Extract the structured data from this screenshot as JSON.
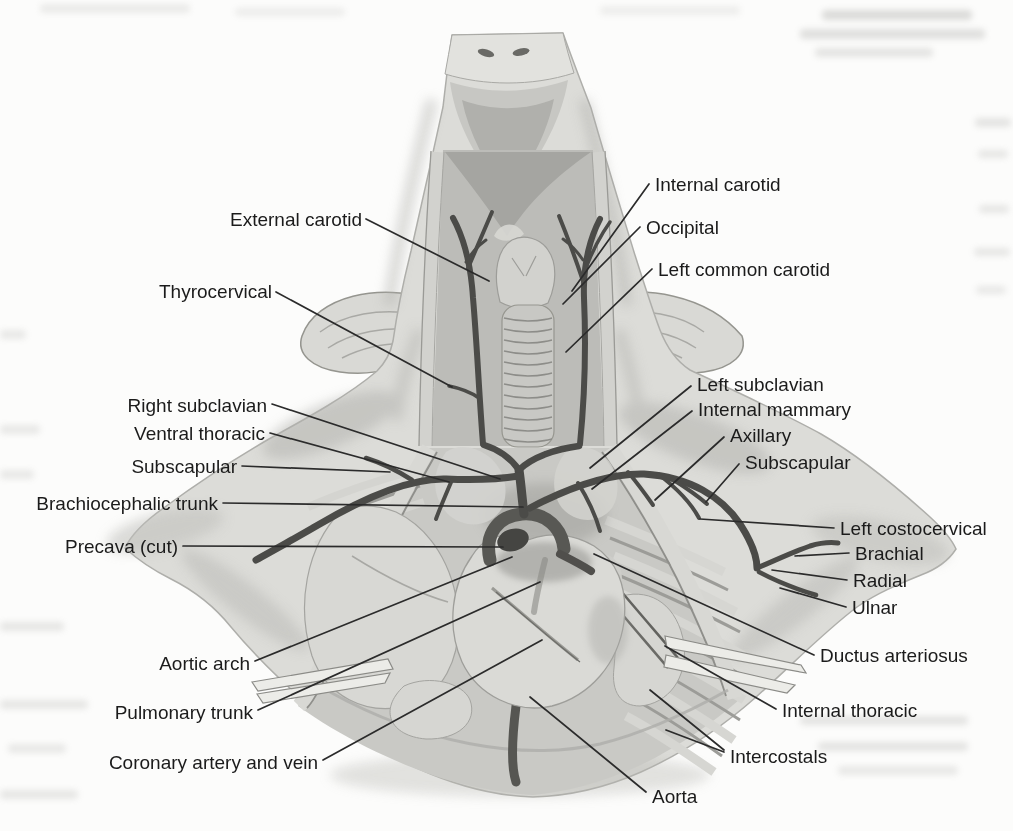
{
  "figure": {
    "type": "labeled-anatomical-illustration",
    "subject_note": "",
    "palette": {
      "paper": "#fcfcfb",
      "body_gray": "#dcdcd8",
      "shade_gray": "#b4b4b0",
      "vessel_dark": "#4b4b48",
      "bone_white": "#ecece8",
      "label_text": "#1b1b1b",
      "leader_line": "#2b2b2b"
    }
  },
  "style": {
    "label_color": "#1b1b1b",
    "leader_color": "#2b2b2b",
    "leader_width": 1.7,
    "label_font_size": 19
  },
  "labels": [
    {
      "id": "external-carotid",
      "text": "External carotid",
      "x": 362,
      "y": 219,
      "anchor": "end",
      "leaders": [
        [
          366,
          219,
          489,
          281
        ]
      ]
    },
    {
      "id": "thyrocervical",
      "text": "Thyrocervical",
      "x": 272,
      "y": 291,
      "anchor": "end",
      "leaders": [
        [
          276,
          292,
          452,
          387
        ]
      ]
    },
    {
      "id": "right-subclavian",
      "text": "Right subclavian",
      "x": 267,
      "y": 405,
      "anchor": "end",
      "leaders": [
        [
          272,
          404,
          500,
          479
        ]
      ]
    },
    {
      "id": "ventral-thoracic",
      "text": "Ventral thoracic",
      "x": 265,
      "y": 433,
      "anchor": "end",
      "leaders": [
        [
          270,
          433,
          449,
          482
        ]
      ]
    },
    {
      "id": "subscapular-left",
      "text": "Subscapular",
      "x": 237,
      "y": 466,
      "anchor": "end",
      "leaders": [
        [
          242,
          466,
          390,
          472
        ]
      ]
    },
    {
      "id": "brachiocephalic-trunk",
      "text": "Brachiocephalic trunk",
      "x": 218,
      "y": 503,
      "anchor": "end",
      "leaders": [
        [
          223,
          503,
          523,
          507
        ]
      ]
    },
    {
      "id": "precava-cut",
      "text": "Precava (cut)",
      "x": 178,
      "y": 546,
      "anchor": "end",
      "leaders": [
        [
          183,
          546,
          503,
          547
        ]
      ]
    },
    {
      "id": "aortic-arch",
      "text": "Aortic arch",
      "x": 250,
      "y": 663,
      "anchor": "end",
      "leaders": [
        [
          255,
          661,
          512,
          557
        ]
      ]
    },
    {
      "id": "pulmonary-trunk",
      "text": "Pulmonary trunk",
      "x": 253,
      "y": 712,
      "anchor": "end",
      "leaders": [
        [
          258,
          710,
          540,
          582
        ]
      ]
    },
    {
      "id": "coronary-artery-vein",
      "text": "Coronary artery and vein",
      "x": 318,
      "y": 762,
      "anchor": "end",
      "leaders": [
        [
          323,
          760,
          542,
          640
        ]
      ]
    },
    {
      "id": "internal-carotid",
      "text": "Internal carotid",
      "x": 655,
      "y": 184,
      "anchor": "start",
      "leaders": [
        [
          649,
          184,
          572,
          291
        ]
      ]
    },
    {
      "id": "occipital",
      "text": "Occipital",
      "x": 646,
      "y": 227,
      "anchor": "start",
      "leaders": [
        [
          640,
          227,
          563,
          304
        ]
      ]
    },
    {
      "id": "left-common-carotid",
      "text": "Left common carotid",
      "x": 658,
      "y": 269,
      "anchor": "start",
      "leaders": [
        [
          652,
          269,
          566,
          352
        ]
      ]
    },
    {
      "id": "left-subclavian",
      "text": "Left subclavian",
      "x": 697,
      "y": 384,
      "anchor": "start",
      "leaders": [
        [
          691,
          386,
          590,
          468
        ]
      ]
    },
    {
      "id": "internal-mammary",
      "text": "Internal mammary",
      "x": 698,
      "y": 409,
      "anchor": "start",
      "leaders": [
        [
          692,
          411,
          592,
          489
        ]
      ]
    },
    {
      "id": "axillary",
      "text": "Axillary",
      "x": 730,
      "y": 435,
      "anchor": "start",
      "leaders": [
        [
          724,
          437,
          655,
          500
        ]
      ]
    },
    {
      "id": "subscapular-right",
      "text": "Subscapular",
      "x": 745,
      "y": 462,
      "anchor": "start",
      "leaders": [
        [
          739,
          464,
          706,
          502
        ]
      ]
    },
    {
      "id": "left-costocervical",
      "text": "Left costocervical",
      "x": 840,
      "y": 528,
      "anchor": "start",
      "leaders": [
        [
          834,
          528,
          700,
          519
        ]
      ]
    },
    {
      "id": "brachial",
      "text": "Brachial",
      "x": 855,
      "y": 553,
      "anchor": "start",
      "leaders": [
        [
          849,
          553,
          795,
          556
        ]
      ]
    },
    {
      "id": "radial",
      "text": "Radial",
      "x": 853,
      "y": 580,
      "anchor": "start",
      "leaders": [
        [
          847,
          580,
          772,
          570
        ]
      ]
    },
    {
      "id": "ulnar",
      "text": "Ulnar",
      "x": 852,
      "y": 607,
      "anchor": "start",
      "leaders": [
        [
          846,
          607,
          780,
          588
        ]
      ]
    },
    {
      "id": "ductus-arteriosus",
      "text": "Ductus arteriosus",
      "x": 820,
      "y": 655,
      "anchor": "start",
      "leaders": [
        [
          814,
          655,
          594,
          554
        ]
      ]
    },
    {
      "id": "internal-thoracic",
      "text": "Internal thoracic",
      "x": 782,
      "y": 710,
      "anchor": "start",
      "leaders": [
        [
          776,
          709,
          665,
          646
        ]
      ]
    },
    {
      "id": "intercostals",
      "text": "Intercostals",
      "x": 730,
      "y": 756,
      "anchor": "start",
      "leaders": [
        [
          724,
          750,
          650,
          690
        ],
        [
          724,
          752,
          666,
          730
        ]
      ]
    },
    {
      "id": "aorta",
      "text": "Aorta",
      "x": 652,
      "y": 796,
      "anchor": "start",
      "leaders": [
        [
          646,
          792,
          530,
          697
        ]
      ]
    }
  ]
}
